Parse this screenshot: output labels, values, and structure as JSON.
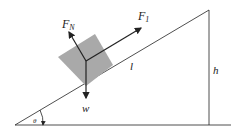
{
  "diagram": {
    "labels": {
      "normal_force": "F",
      "normal_force_sub": "N",
      "applied_force": "F",
      "applied_force_sub": "1",
      "weight": "w",
      "length": "l",
      "height": "h",
      "angle": "θ"
    },
    "colors": {
      "block": "#a9a9a9",
      "lines": "#222222"
    }
  }
}
